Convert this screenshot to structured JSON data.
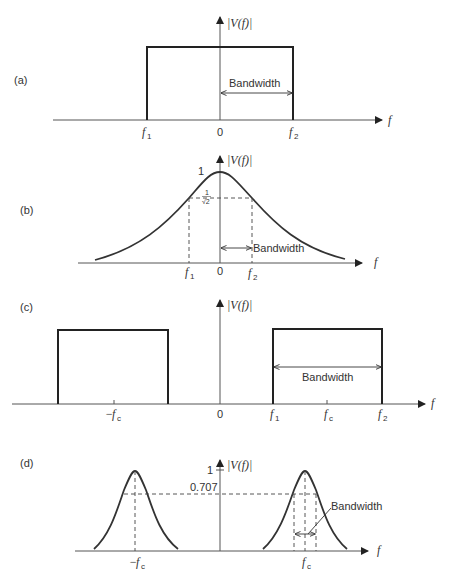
{
  "figure": {
    "y_axis_label": "|V(f)|",
    "x_axis_label": "f",
    "bandwidth_label": "Bandwidth",
    "zero_label": "0"
  },
  "panels": [
    {
      "id": "a",
      "label": "(a)",
      "shape": "rectangular baseband spectrum",
      "ticks": [
        "f1",
        "0",
        "f2"
      ],
      "bandwidth_from": "0",
      "bandwidth_to": "f2"
    },
    {
      "id": "b",
      "label": "(b)",
      "shape": "bell-shaped baseband spectrum",
      "peak_label": "1",
      "half_power_label_num": "1",
      "half_power_label_den": "√2",
      "ticks": [
        "f1",
        "0",
        "f2"
      ],
      "bandwidth_from": "0",
      "bandwidth_to": "f2"
    },
    {
      "id": "c",
      "label": "(c)",
      "shape": "rectangular bandpass spectrum",
      "ticks": [
        "−fc",
        "0",
        "f1",
        "fc",
        "f2"
      ],
      "bandwidth_from": "f1",
      "bandwidth_to": "f2"
    },
    {
      "id": "d",
      "label": "(d)",
      "shape": "bell-shaped bandpass spectrum",
      "peak_label": "1",
      "half_power_value": "0.707",
      "ticks": [
        "−fc",
        "fc"
      ],
      "bandwidth_around": "fc"
    }
  ],
  "text": {
    "a_label": "(a)",
    "b_label": "(b)",
    "c_label": "(c)",
    "d_label": "(d)",
    "vf": "|V(f)|",
    "f": "f",
    "zero": "0",
    "one": "1",
    "bw": "Bandwidth",
    "f_base": "f",
    "sub1": "1",
    "sub2": "2",
    "subc": "c",
    "minus": "−",
    "inv_sqrt2_num": "1",
    "inv_sqrt2_den": "√2",
    "v0707": "0.707"
  }
}
